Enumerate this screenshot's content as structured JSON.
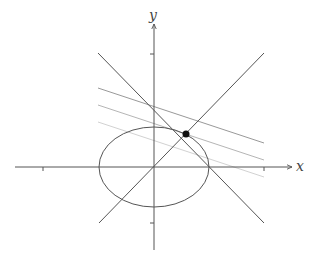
{
  "diagram": {
    "type": "coordinate-plane",
    "axes": {
      "x_label": "x",
      "y_label": "y",
      "origin_px": [
        154,
        167
      ],
      "x_range_px": [
        15,
        292
      ],
      "y_range_px": [
        250,
        24
      ],
      "x_ticks_px": [
        43,
        264
      ],
      "y_ticks_px": [
        54,
        223
      ]
    },
    "ellipse": {
      "center_px": [
        154,
        167
      ],
      "rx_px": 55,
      "ry_px": 40,
      "color": "#555555"
    },
    "lines": [
      {
        "name": "line-increasing",
        "from": [
          99,
          223
        ],
        "to": [
          264,
          53
        ],
        "color": "#555555"
      },
      {
        "name": "line-decreasing",
        "from": [
          98,
          53
        ],
        "to": [
          264,
          223
        ],
        "color": "#555555"
      },
      {
        "name": "level-line-1",
        "from": [
          98,
          88
        ],
        "to": [
          264,
          143
        ],
        "color": "#999999"
      },
      {
        "name": "level-line-2",
        "from": [
          98,
          105
        ],
        "to": [
          264,
          160
        ],
        "color": "#b5b5b5"
      },
      {
        "name": "level-line-3",
        "from": [
          98,
          122
        ],
        "to": [
          264,
          177
        ],
        "color": "#d2d2d2"
      }
    ],
    "point": {
      "center_px": [
        186,
        134
      ],
      "r_px": 3.5,
      "color": "#111111"
    },
    "axis_color": "#555555"
  }
}
